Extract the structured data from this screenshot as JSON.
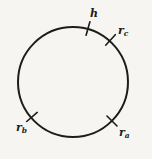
{
  "figure": {
    "background_color": "#f6f5f1",
    "stroke_color": "#1c1c1c",
    "labels": {
      "h": {
        "base": "h",
        "sub": ""
      },
      "rc": {
        "base": "r",
        "sub": "c"
      },
      "rb": {
        "base": "r",
        "sub": "b"
      },
      "ra": {
        "base": "r",
        "sub": "a"
      }
    }
  }
}
